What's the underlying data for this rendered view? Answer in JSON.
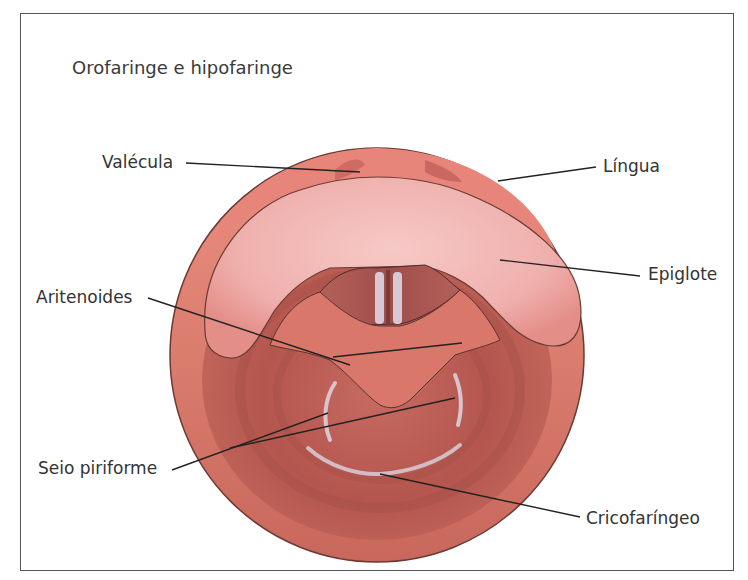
{
  "title": "Orofaringe e hipofaringe",
  "labels": {
    "valecula": "Valécula",
    "lingua": "Língua",
    "epiglote": "Epiglote",
    "aritenoides": "Aritenoides",
    "seio_piriforme": "Seio piriforme",
    "cricofaringeo": "Cricofaríngeo"
  },
  "colors": {
    "outer_ring": "#e07a6e",
    "tongue_base": "#e8857a",
    "epiglottis": "#f2b4b4",
    "pharynx_deep": "#b85a52",
    "larynx": "#d9786a",
    "vocal_cords": "#d8c8d4",
    "leader_line": "#222222"
  }
}
